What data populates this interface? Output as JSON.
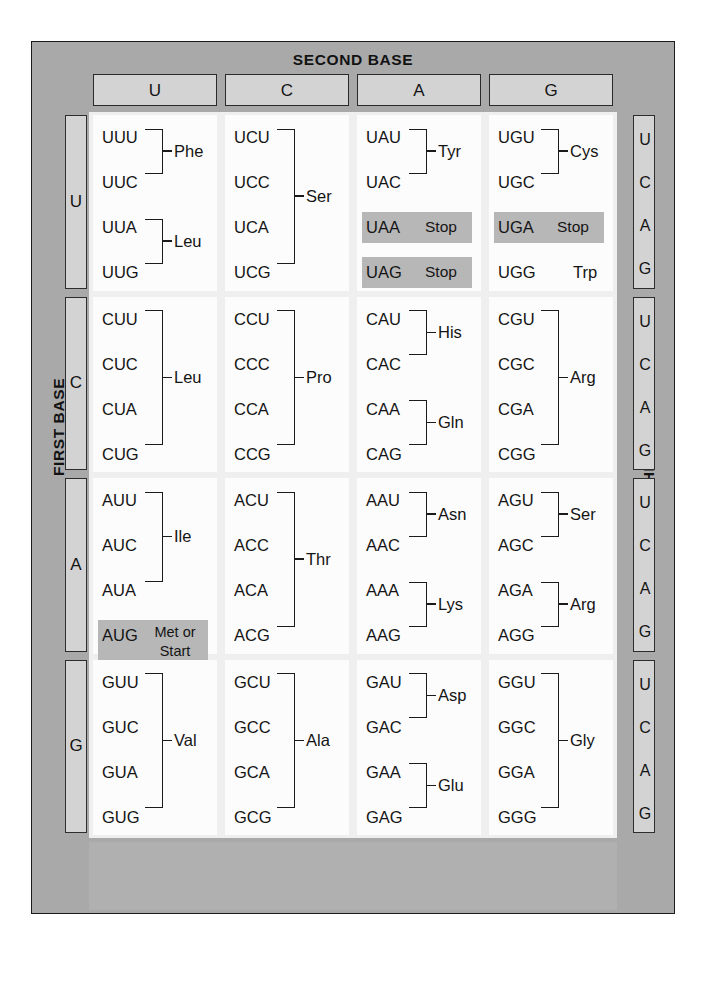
{
  "figure": {
    "second_base_title": "SECOND BASE",
    "first_base_title": "FIRST BASE",
    "third_base_title": "THIRD BASE",
    "column_headers": [
      "U",
      "C",
      "A",
      "G"
    ],
    "row_headers": [
      "U",
      "C",
      "A",
      "G"
    ],
    "third_base_letters": [
      "U",
      "C",
      "A",
      "G"
    ],
    "colors": {
      "frame_gray": "#a9a9a9",
      "header_box_gray": "#d3d3d3",
      "highlight_gray": "#b7b7b7",
      "cell_white": "#fcfcfc",
      "text_black": "#141414"
    }
  },
  "chart_data": {
    "type": "table",
    "title": "SECOND BASE",
    "xlabel": "SECOND BASE",
    "ylabel": "FIRST BASE",
    "zlabel": "THIRD BASE",
    "categories": [
      "U",
      "C",
      "A",
      "G"
    ],
    "rows": [
      "U",
      "C",
      "A",
      "G"
    ],
    "third_base": [
      "U",
      "C",
      "A",
      "G"
    ],
    "cells": [
      {
        "first": "U",
        "second": "U",
        "codons": [
          "UUU",
          "UUC",
          "UUA",
          "UUG"
        ],
        "groups": [
          {
            "codons": [
              "UUU",
              "UUC"
            ],
            "amino_acid": "Phe"
          },
          {
            "codons": [
              "UUA",
              "UUG"
            ],
            "amino_acid": "Leu"
          }
        ]
      },
      {
        "first": "U",
        "second": "C",
        "codons": [
          "UCU",
          "UCC",
          "UCA",
          "UCG"
        ],
        "groups": [
          {
            "codons": [
              "UCU",
              "UCC",
              "UCA",
              "UCG"
            ],
            "amino_acid": "Ser"
          }
        ]
      },
      {
        "first": "U",
        "second": "A",
        "codons": [
          "UAU",
          "UAC",
          "UAA",
          "UAG"
        ],
        "groups": [
          {
            "codons": [
              "UAU",
              "UAC"
            ],
            "amino_acid": "Tyr"
          },
          {
            "codons": [
              "UAA"
            ],
            "amino_acid": "Stop",
            "highlight": true
          },
          {
            "codons": [
              "UAG"
            ],
            "amino_acid": "Stop",
            "highlight": true
          }
        ]
      },
      {
        "first": "U",
        "second": "G",
        "codons": [
          "UGU",
          "UGC",
          "UGA",
          "UGG"
        ],
        "groups": [
          {
            "codons": [
              "UGU",
              "UGC"
            ],
            "amino_acid": "Cys"
          },
          {
            "codons": [
              "UGA"
            ],
            "amino_acid": "Stop",
            "highlight": true
          },
          {
            "codons": [
              "UGG"
            ],
            "amino_acid": "Trp"
          }
        ]
      },
      {
        "first": "C",
        "second": "U",
        "codons": [
          "CUU",
          "CUC",
          "CUA",
          "CUG"
        ],
        "groups": [
          {
            "codons": [
              "CUU",
              "CUC",
              "CUA",
              "CUG"
            ],
            "amino_acid": "Leu"
          }
        ]
      },
      {
        "first": "C",
        "second": "C",
        "codons": [
          "CCU",
          "CCC",
          "CCA",
          "CCG"
        ],
        "groups": [
          {
            "codons": [
              "CCU",
              "CCC",
              "CCA",
              "CCG"
            ],
            "amino_acid": "Pro"
          }
        ]
      },
      {
        "first": "C",
        "second": "A",
        "codons": [
          "CAU",
          "CAC",
          "CAA",
          "CAG"
        ],
        "groups": [
          {
            "codons": [
              "CAU",
              "CAC"
            ],
            "amino_acid": "His"
          },
          {
            "codons": [
              "CAA",
              "CAG"
            ],
            "amino_acid": "Gln"
          }
        ]
      },
      {
        "first": "C",
        "second": "G",
        "codons": [
          "CGU",
          "CGC",
          "CGA",
          "CGG"
        ],
        "groups": [
          {
            "codons": [
              "CGU",
              "CGC",
              "CGA",
              "CGG"
            ],
            "amino_acid": "Arg"
          }
        ]
      },
      {
        "first": "A",
        "second": "U",
        "codons": [
          "AUU",
          "AUC",
          "AUA",
          "AUG"
        ],
        "groups": [
          {
            "codons": [
              "AUU",
              "AUC",
              "AUA"
            ],
            "amino_acid": "Ile"
          },
          {
            "codons": [
              "AUG"
            ],
            "amino_acid": "Met or Start",
            "highlight": true
          }
        ]
      },
      {
        "first": "A",
        "second": "C",
        "codons": [
          "ACU",
          "ACC",
          "ACA",
          "ACG"
        ],
        "groups": [
          {
            "codons": [
              "ACU",
              "ACC",
              "ACA",
              "ACG"
            ],
            "amino_acid": "Thr"
          }
        ]
      },
      {
        "first": "A",
        "second": "A",
        "codons": [
          "AAU",
          "AAC",
          "AAA",
          "AAG"
        ],
        "groups": [
          {
            "codons": [
              "AAU",
              "AAC"
            ],
            "amino_acid": "Asn"
          },
          {
            "codons": [
              "AAA",
              "AAG"
            ],
            "amino_acid": "Lys"
          }
        ]
      },
      {
        "first": "A",
        "second": "G",
        "codons": [
          "AGU",
          "AGC",
          "AGA",
          "AGG"
        ],
        "groups": [
          {
            "codons": [
              "AGU",
              "AGC"
            ],
            "amino_acid": "Ser"
          },
          {
            "codons": [
              "AGA",
              "AGG"
            ],
            "amino_acid": "Arg"
          }
        ]
      },
      {
        "first": "G",
        "second": "U",
        "codons": [
          "GUU",
          "GUC",
          "GUA",
          "GUG"
        ],
        "groups": [
          {
            "codons": [
              "GUU",
              "GUC",
              "GUA",
              "GUG"
            ],
            "amino_acid": "Val"
          }
        ]
      },
      {
        "first": "G",
        "second": "C",
        "codons": [
          "GCU",
          "GCC",
          "GCA",
          "GCG"
        ],
        "groups": [
          {
            "codons": [
              "GCU",
              "GCC",
              "GCA",
              "GCG"
            ],
            "amino_acid": "Ala"
          }
        ]
      },
      {
        "first": "G",
        "second": "A",
        "codons": [
          "GAU",
          "GAC",
          "GAA",
          "GAG"
        ],
        "groups": [
          {
            "codons": [
              "GAU",
              "GAC"
            ],
            "amino_acid": "Asp"
          },
          {
            "codons": [
              "GAA",
              "GAG"
            ],
            "amino_acid": "Glu"
          }
        ]
      },
      {
        "first": "G",
        "second": "G",
        "codons": [
          "GGU",
          "GGC",
          "GGA",
          "GGG"
        ],
        "groups": [
          {
            "codons": [
              "GGU",
              "GGC",
              "GGA",
              "GGG"
            ],
            "amino_acid": "Gly"
          }
        ]
      }
    ],
    "labels": {
      "stop": "Stop",
      "met_or_start_line1": "Met or",
      "met_or_start_line2": "Start"
    }
  }
}
